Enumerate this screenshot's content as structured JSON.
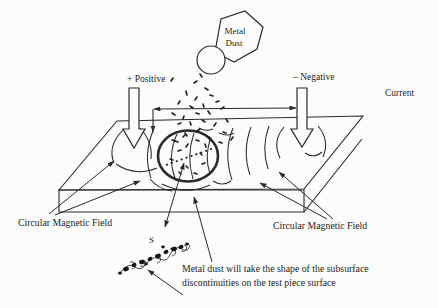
{
  "diagram": {
    "type": "magnetic-particle-inspection-illustration",
    "labels": {
      "container_line1": "Metal",
      "container_line2": "Dust",
      "positive": "+ Positive",
      "negative": "– Negative",
      "current": "Current",
      "field_left": "Circular Magnetic Field",
      "field_right": "Circular Magnetic Field",
      "pole": "S",
      "caption_line1": "Metal dust will take the shape of the subsurface",
      "caption_line2": "discontinuities on the test piece surface"
    },
    "colors": {
      "ink": "#2a2a2a",
      "background": "#fcfcfa"
    }
  }
}
